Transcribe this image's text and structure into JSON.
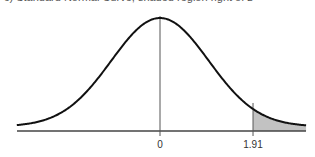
{
  "cut_text": "c) Standard Normal Curve, shaded region right of z",
  "chart_data": {
    "type": "area",
    "title": "",
    "xlabel": "",
    "ylabel": "",
    "x_ticks": [
      {
        "value": 0,
        "label": "0"
      },
      {
        "value": 1.91,
        "label": "1.91"
      }
    ],
    "xlim": [
      -2.94,
      3.0
    ],
    "mean": 0,
    "sd": 1,
    "shaded_region": {
      "from": 1.91,
      "to": 3.0,
      "side": "right"
    },
    "grid": false,
    "legend": null
  },
  "colors": {
    "curve": "#111111",
    "axis": "#444444",
    "shade": "#c8c8c8",
    "tick": "#555555"
  }
}
